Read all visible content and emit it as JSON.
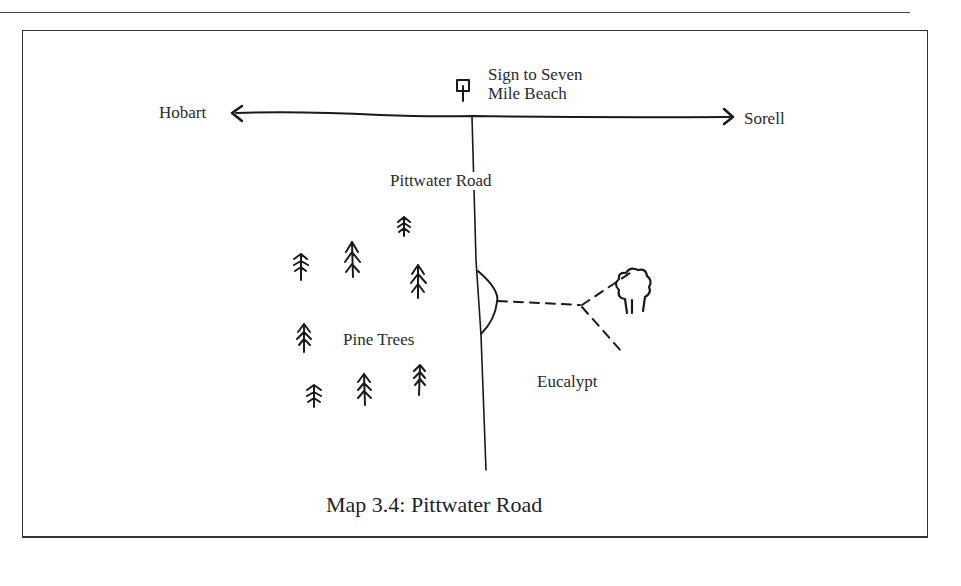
{
  "map": {
    "caption": "Map 3.4:  Pittwater Road",
    "labels": {
      "sign_line1": "Sign to Seven",
      "sign_line2": "Mile Beach",
      "west": "Hobart",
      "east": "Sorell",
      "road": "Pittwater Road",
      "pines": "Pine Trees",
      "eucalypt": "Eucalypt"
    },
    "icons": [
      "sign-icon",
      "pine-tree-icon",
      "eucalypt-tree-icon",
      "arrow-left-icon",
      "arrow-right-icon",
      "track-dashed-line",
      "turnout-arc"
    ]
  }
}
